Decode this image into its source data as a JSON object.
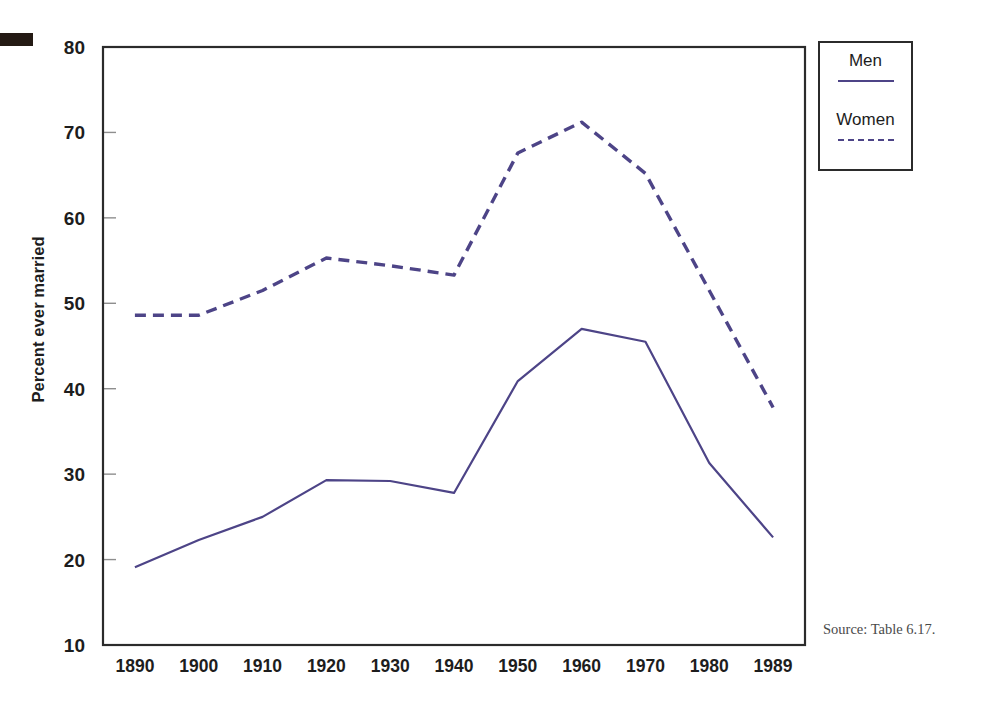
{
  "figure": {
    "y_axis_title": "Percent ever married",
    "source_note": "Source: Table 6.17.",
    "line_color": "#4d4487",
    "axis_color": "#2b2b2b",
    "background": "#ffffff"
  },
  "legend": {
    "position": "top-right",
    "entries": [
      {
        "label": "Men",
        "style": "solid",
        "swatch": "solid-line-swatch"
      },
      {
        "label": "Women",
        "style": "dashed",
        "swatch": "dashed-line-swatch"
      }
    ]
  },
  "chart_data": {
    "type": "line",
    "title": "",
    "subtitle": "",
    "xlabel": "",
    "ylabel": "Percent ever married",
    "categories": [
      "1890",
      "1900",
      "1910",
      "1920",
      "1930",
      "1940",
      "1950",
      "1960",
      "1970",
      "1980",
      "1989"
    ],
    "x_tick_labels": [
      "1890",
      "1900",
      "1910",
      "1920",
      "1930",
      "1940",
      "1950",
      "1960",
      "1970",
      "1980",
      "1989"
    ],
    "y_tick_labels": [
      "10",
      "20",
      "30",
      "40",
      "50",
      "60",
      "70",
      "80"
    ],
    "y_ticks": [
      10,
      20,
      30,
      40,
      50,
      60,
      70,
      80
    ],
    "ylim": [
      10,
      80
    ],
    "grid": false,
    "legend_position": "top-right",
    "series": [
      {
        "name": "Men",
        "style": "solid",
        "color": "#4d4487",
        "values": [
          19.1,
          22.3,
          25.0,
          29.3,
          29.2,
          27.8,
          40.9,
          47.0,
          45.5,
          31.3,
          22.6
        ]
      },
      {
        "name": "Women",
        "style": "dashed",
        "color": "#4d4487",
        "values": [
          48.6,
          48.6,
          51.5,
          55.3,
          54.4,
          53.3,
          67.6,
          71.2,
          65.2,
          51.5,
          37.8
        ]
      }
    ],
    "annotations": [
      "Source: Table 6.17."
    ]
  }
}
